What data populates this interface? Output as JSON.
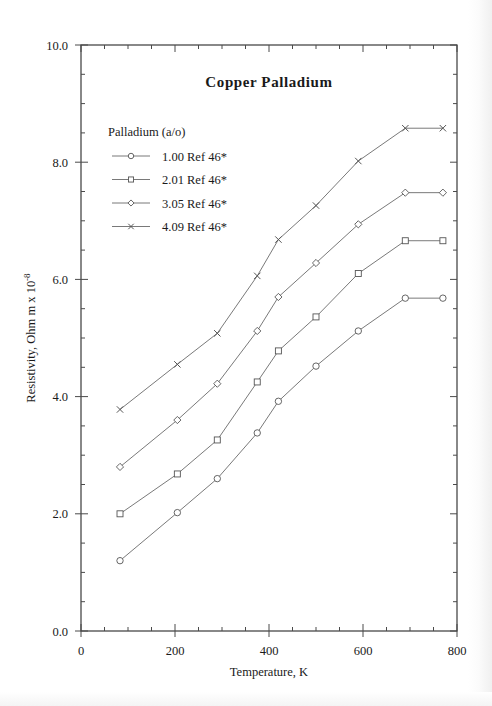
{
  "chart_data": {
    "type": "line",
    "title": "Copper Palladium",
    "xlabel": "Temperature,  K",
    "ylabel": "Resistivity, Ohm m x 10",
    "ylabel_exponent": "-8",
    "xlim": [
      0,
      800
    ],
    "ylim": [
      0,
      10
    ],
    "xticks": [
      0,
      200,
      400,
      600,
      800
    ],
    "xtick_labels": [
      "0",
      "200",
      "400",
      "600",
      "800"
    ],
    "yticks": [
      0,
      2,
      4,
      6,
      8,
      10
    ],
    "ytick_labels": [
      "0.0",
      "2.0",
      "4.0",
      "6.0",
      "8.0",
      "10.0"
    ],
    "x_minor_step": 50,
    "y_minor_step": 0.5,
    "grid": false,
    "legend_position": "upper-left-inside",
    "legend_title": "Palladium (a/o)",
    "series": [
      {
        "name": "1.00 Ref 46*",
        "value": "1.00",
        "ref": "Ref 46*",
        "marker": "circle",
        "x": [
          83,
          205,
          290,
          375,
          420,
          500,
          590,
          690,
          770
        ],
        "y": [
          1.2,
          2.02,
          2.6,
          3.38,
          3.92,
          4.52,
          5.12,
          5.68,
          5.68
        ]
      },
      {
        "name": "2.01 Ref 46*",
        "value": "2.01",
        "ref": "Ref 46*",
        "marker": "square",
        "x": [
          83,
          205,
          290,
          375,
          420,
          500,
          590,
          690,
          770
        ],
        "y": [
          2.0,
          2.68,
          3.26,
          4.25,
          4.78,
          5.36,
          6.1,
          6.66,
          6.66
        ]
      },
      {
        "name": "3.05 Ref 46*",
        "value": "3.05",
        "ref": "Ref 46*",
        "marker": "diamond",
        "x": [
          83,
          205,
          290,
          375,
          420,
          500,
          590,
          690,
          770
        ],
        "y": [
          2.8,
          3.6,
          4.22,
          5.12,
          5.7,
          6.28,
          6.94,
          7.48,
          7.48
        ]
      },
      {
        "name": "4.09 Ref 46*",
        "value": "4.09",
        "ref": "Ref 46*",
        "marker": "cross",
        "x": [
          83,
          205,
          290,
          375,
          420,
          500,
          590,
          690,
          770
        ],
        "y": [
          3.78,
          4.55,
          5.08,
          6.06,
          6.68,
          7.26,
          8.02,
          8.58,
          8.58
        ]
      }
    ]
  },
  "legend": {
    "title": "Palladium (a/o)",
    "items": [
      {
        "label": "1.00 Ref 46*",
        "marker": "circle"
      },
      {
        "label": "2.01 Ref 46*",
        "marker": "square"
      },
      {
        "label": "3.05 Ref 46*",
        "marker": "diamond"
      },
      {
        "label": "4.09 Ref 46*",
        "marker": "cross"
      }
    ]
  },
  "axes": {
    "x_title": "Temperature,  K",
    "y_title": "Resistivity, Ohm m x 10",
    "y_title_exp": "-8"
  },
  "title": "Copper Palladium"
}
